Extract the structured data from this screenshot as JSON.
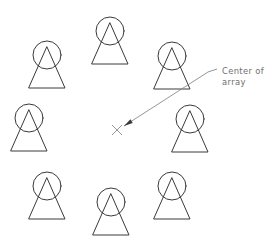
{
  "figure": {
    "canvas": {
      "width": 275,
      "height": 247
    },
    "colors": {
      "background": "#ffffff",
      "element_stroke": "#3a3a3a",
      "leader_stroke": "#8a8a8a",
      "text_fill": "#6f6f6f"
    },
    "annotation": {
      "line1": "Center of",
      "line2": "array",
      "text_x": 222,
      "text_y1": 74,
      "text_y2": 85,
      "leader_start_x": 217,
      "leader_start_y": 69,
      "leader_bend_x": 208,
      "leader_bend_y": 72,
      "leader_end_x": 124,
      "leader_end_y": 126
    },
    "center_marker": {
      "name": "center-of-array-cross",
      "x": 117,
      "y": 130,
      "arm": 5
    },
    "elements": [
      {
        "id": "element-top-left",
        "label": "array element top-left",
        "circle_cx": 47,
        "circle_cy": 55,
        "circle_r": 14,
        "tri_apex_x": 47,
        "tri_apex_y": 47,
        "tri_left_x": 29,
        "tri_right_x": 65,
        "tri_base_y": 88
      },
      {
        "id": "element-top-center",
        "label": "array element top-center",
        "circle_cx": 110,
        "circle_cy": 31,
        "circle_r": 14,
        "tri_apex_x": 110,
        "tri_apex_y": 23,
        "tri_left_x": 92,
        "tri_right_x": 128,
        "tri_base_y": 64
      },
      {
        "id": "element-top-right",
        "label": "array element top-right",
        "circle_cx": 172,
        "circle_cy": 56,
        "circle_r": 14,
        "tri_apex_x": 172,
        "tri_apex_y": 48,
        "tri_left_x": 154,
        "tri_right_x": 190,
        "tri_base_y": 89
      },
      {
        "id": "element-middle-left",
        "label": "array element middle-left",
        "circle_cx": 29,
        "circle_cy": 118,
        "circle_r": 14,
        "tri_apex_x": 29,
        "tri_apex_y": 110,
        "tri_left_x": 11,
        "tri_right_x": 47,
        "tri_base_y": 151
      },
      {
        "id": "element-middle-right",
        "label": "array element middle-right",
        "circle_cx": 190,
        "circle_cy": 119,
        "circle_r": 14,
        "tri_apex_x": 190,
        "tri_apex_y": 111,
        "tri_left_x": 172,
        "tri_right_x": 208,
        "tri_base_y": 152
      },
      {
        "id": "element-bottom-left",
        "label": "array element bottom-left",
        "circle_cx": 47,
        "circle_cy": 186,
        "circle_r": 14,
        "tri_apex_x": 47,
        "tri_apex_y": 178,
        "tri_left_x": 29,
        "tri_right_x": 65,
        "tri_base_y": 219
      },
      {
        "id": "element-bottom-center",
        "label": "array element bottom-center",
        "circle_cx": 111,
        "circle_cy": 202,
        "circle_r": 14,
        "tri_apex_x": 111,
        "tri_apex_y": 194,
        "tri_left_x": 93,
        "tri_right_x": 129,
        "tri_base_y": 235
      },
      {
        "id": "element-bottom-right",
        "label": "array element bottom-right",
        "circle_cx": 172,
        "circle_cy": 186,
        "circle_r": 14,
        "tri_apex_x": 172,
        "tri_apex_y": 178,
        "tri_left_x": 154,
        "tri_right_x": 190,
        "tri_base_y": 219
      }
    ]
  }
}
